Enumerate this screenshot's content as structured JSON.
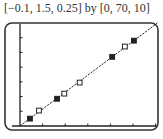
{
  "caption": "[−0.1, 1.5, 0.25] by [0, 70, 10]",
  "chart_data": {
    "type": "scatter",
    "title": "[−0.1, 1.5, 0.25] by [0, 70, 10]",
    "xlabel": "",
    "ylabel": "",
    "xlim": [
      -0.1,
      1.5
    ],
    "xscl": 0.25,
    "ylim": [
      0,
      70
    ],
    "yscl": 10,
    "grid": false,
    "legend": null,
    "series": [
      {
        "name": "filled squares",
        "marker": "filled-square",
        "x": [
          0.11,
          0.41,
          1.02,
          1.26
        ],
        "y": [
          5,
          18.5,
          47,
          58
        ]
      },
      {
        "name": "open squares",
        "marker": "open-square",
        "x": [
          0.21,
          0.49,
          0.66,
          1.16
        ],
        "y": [
          10.5,
          22,
          29.5,
          54
        ]
      },
      {
        "name": "regression line",
        "type": "line",
        "x": [
          0,
          1.52
        ],
        "y": [
          0,
          70
        ],
        "slope": 46
      }
    ]
  },
  "colors": {
    "ink": "#222222",
    "frame": "#333333"
  }
}
